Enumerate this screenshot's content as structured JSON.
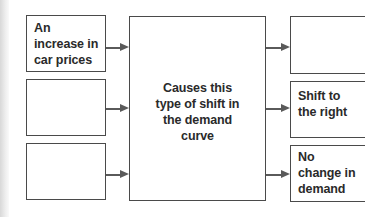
{
  "diagram": {
    "left_boxes": [
      {
        "label": "An\nincrease in\ncar prices"
      },
      {
        "label": ""
      },
      {
        "label": ""
      }
    ],
    "center_box": {
      "label": "Causes this\ntype of shift in\nthe demand\ncurve"
    },
    "right_boxes": [
      {
        "label": ""
      },
      {
        "label": "Shift to\nthe right"
      },
      {
        "label": "No\nchange in\ndemand"
      }
    ],
    "colors": {
      "border": "#4a4a4a",
      "arrow": "#5a5a5a",
      "text": "#2a2a2a",
      "background": "#ffffff"
    }
  }
}
